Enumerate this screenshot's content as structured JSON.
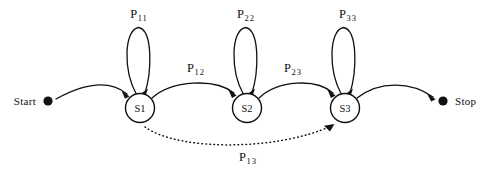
{
  "diagram": {
    "type": "state-transition-diagram",
    "background_color": "#ffffff",
    "stroke_color": "#111111",
    "terminals": [
      {
        "id": "start",
        "label": "Start",
        "x": 48,
        "y": 101,
        "dot_radius": 4.6,
        "label_side": "left"
      },
      {
        "id": "stop",
        "label": "Stop",
        "x": 443,
        "y": 101,
        "dot_radius": 4.6,
        "label_side": "right"
      }
    ],
    "states": [
      {
        "id": "S1",
        "label": "S1",
        "x": 140,
        "y": 108,
        "r": 14.5
      },
      {
        "id": "S2",
        "label": "S2",
        "x": 247,
        "y": 108,
        "r": 14.5
      },
      {
        "id": "S3",
        "label": "S3",
        "x": 345,
        "y": 108,
        "r": 14.5
      }
    ],
    "self_loops": [
      {
        "id": "loop-s1",
        "state": "S1",
        "label_base": "P",
        "label_sub": "11",
        "label_x": 139,
        "label_y": 15,
        "style": "solid"
      },
      {
        "id": "loop-s2",
        "state": "S2",
        "label_base": "P",
        "label_sub": "22",
        "label_x": 246,
        "label_y": 15,
        "style": "solid"
      },
      {
        "id": "loop-s3",
        "state": "S3",
        "label_base": "P",
        "label_sub": "33",
        "label_x": 348,
        "label_y": 15,
        "style": "solid"
      }
    ],
    "transitions": [
      {
        "id": "t-start-s1",
        "from": "start",
        "to": "S1",
        "label_base": "",
        "label_sub": "",
        "style": "solid",
        "has_label": false
      },
      {
        "id": "t-s1-s2",
        "from": "S1",
        "to": "S2",
        "label_base": "P",
        "label_sub": "12",
        "label_x": 196,
        "label_y": 69,
        "style": "solid",
        "has_label": true
      },
      {
        "id": "t-s2-s3",
        "from": "S2",
        "to": "S3",
        "label_base": "P",
        "label_sub": "23",
        "label_x": 293,
        "label_y": 69,
        "style": "solid",
        "has_label": true
      },
      {
        "id": "t-s3-stop",
        "from": "S3",
        "to": "stop",
        "label_base": "",
        "label_sub": "",
        "style": "solid",
        "has_label": false
      },
      {
        "id": "t-s1-s3",
        "from": "S1",
        "to": "S3",
        "label_base": "P",
        "label_sub": "13",
        "label_x": 248,
        "label_y": 158,
        "style": "dotted",
        "has_label": true
      }
    ]
  }
}
